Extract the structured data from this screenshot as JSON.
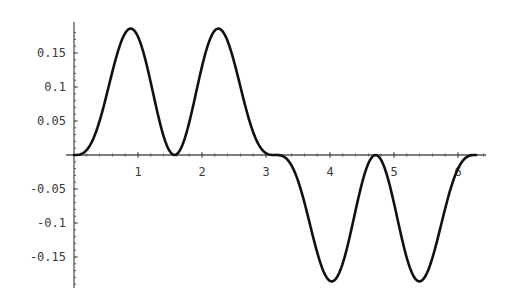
{
  "chart_data": {
    "type": "line",
    "title": "",
    "xlabel": "",
    "ylabel": "",
    "function": "sin(x)^3 * cos(x)^2",
    "xlim": [
      0,
      6.35
    ],
    "ylim": [
      -0.195,
      0.195
    ],
    "grid": false,
    "legend": null,
    "x_ticks": [
      1,
      2,
      3,
      4,
      5,
      6
    ],
    "x_tick_labels": [
      "1",
      "2",
      "3",
      "4",
      "5",
      "6"
    ],
    "y_ticks": [
      0.15,
      0.1,
      0.05,
      -0.05,
      -0.1,
      -0.15
    ],
    "y_tick_labels": [
      "0.15",
      "0.1",
      "0.05",
      "-0.05",
      "-0.1",
      "-0.15"
    ],
    "series": [
      {
        "name": "f(x)",
        "color": "#111111",
        "x": [
          0,
          0.2,
          0.4,
          0.6,
          0.8,
          0.886,
          1.0,
          1.2,
          1.4,
          1.571,
          1.8,
          2.0,
          2.256,
          2.4,
          2.6,
          2.8,
          3.0,
          3.142,
          3.4,
          3.6,
          3.8,
          4.0,
          4.027,
          4.2,
          4.4,
          4.6,
          4.712,
          4.9,
          5.2,
          5.398,
          5.6,
          5.8,
          6.0,
          6.283
        ],
        "y": [
          0,
          0.0075,
          0.0509,
          0.1079,
          0.1594,
          0.1859,
          0.1801,
          0.1178,
          0.0275,
          0,
          0.0444,
          0.1301,
          0.1859,
          0.169,
          0.1152,
          0.0574,
          0.0028,
          0,
          -0.015,
          -0.0647,
          -0.1254,
          -0.183,
          -0.1859,
          -0.1661,
          -0.087,
          -0.0125,
          0,
          -0.0258,
          -0.1365,
          -0.1859,
          -0.158,
          -0.0779,
          -0.0203,
          0
        ]
      }
    ]
  },
  "plot_layout": {
    "origin_px": [
      74,
      155
    ],
    "x_px_per_unit": 64,
    "y_px_per_unit": 680,
    "x_axis_end_px": 486,
    "y_axis_top_px": 22,
    "y_axis_bottom_px": 288
  }
}
